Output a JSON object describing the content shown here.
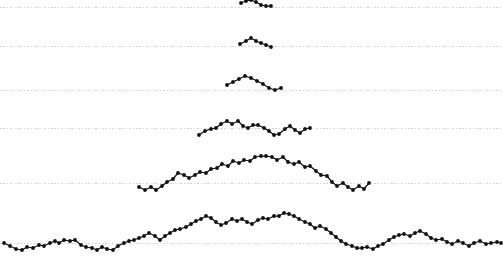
{
  "figure": {
    "background_color": "#ffffff",
    "marker_color": "#111111",
    "line_color": "#111111",
    "gridline_color": "#c9c9c9",
    "caption_clipped": "the caption text is clipped by the figure bottom edge"
  },
  "chart_data": {
    "type": "line",
    "title": "",
    "subtitle": "",
    "xlabel": "",
    "ylabel": "",
    "xlim": [
      0,
      503
    ],
    "ylim": [
      262,
      0
    ],
    "grid": true,
    "grid_orientation": "horizontal",
    "gridline_y_values": [
      7,
      46,
      90,
      128,
      183,
      243
    ],
    "legend_position": "none",
    "annotations": [],
    "tick_labels": {
      "x": [],
      "y": []
    },
    "series": [
      {
        "name": "level-1",
        "baseline_y": 7,
        "marker": "circle",
        "points": [
          [
            241,
            3
          ],
          [
            246,
            1
          ],
          [
            251,
            0
          ],
          [
            256,
            2
          ],
          [
            261,
            5
          ],
          [
            266,
            6
          ],
          [
            271,
            6
          ]
        ]
      },
      {
        "name": "level-2",
        "baseline_y": 46,
        "marker": "circle",
        "points": [
          [
            240,
            44
          ],
          [
            246,
            41
          ],
          [
            251,
            38
          ],
          [
            256,
            41
          ],
          [
            261,
            43
          ],
          [
            266,
            45
          ],
          [
            271,
            47
          ]
        ]
      },
      {
        "name": "level-3",
        "baseline_y": 90,
        "marker": "circle",
        "points": [
          [
            227,
            85
          ],
          [
            233,
            82
          ],
          [
            239,
            79
          ],
          [
            245,
            76
          ],
          [
            251,
            78
          ],
          [
            257,
            81
          ],
          [
            263,
            84
          ],
          [
            269,
            88
          ],
          [
            275,
            90
          ],
          [
            281,
            88
          ]
        ]
      },
      {
        "name": "level-4",
        "baseline_y": 128,
        "marker": "circle",
        "points": [
          [
            199,
            135
          ],
          [
            205,
            131
          ],
          [
            211,
            129
          ],
          [
            216,
            128
          ],
          [
            221,
            124
          ],
          [
            227,
            121
          ],
          [
            232,
            124
          ],
          [
            238,
            121
          ],
          [
            243,
            126
          ],
          [
            248,
            128
          ],
          [
            253,
            125
          ],
          [
            258,
            125
          ],
          [
            264,
            128
          ],
          [
            269,
            131
          ],
          [
            274,
            135
          ],
          [
            279,
            134
          ],
          [
            285,
            129
          ],
          [
            290,
            126
          ],
          [
            295,
            130
          ],
          [
            300,
            133
          ],
          [
            305,
            129
          ],
          [
            310,
            128
          ]
        ]
      },
      {
        "name": "level-5",
        "baseline_y": 183,
        "marker": "circle",
        "points": [
          [
            139,
            187
          ],
          [
            145,
            190
          ],
          [
            151,
            187
          ],
          [
            156,
            190
          ],
          [
            162,
            186
          ],
          [
            167,
            182
          ],
          [
            173,
            179
          ],
          [
            178,
            173
          ],
          [
            184,
            175
          ],
          [
            189,
            178
          ],
          [
            195,
            175
          ],
          [
            200,
            172
          ],
          [
            206,
            173
          ],
          [
            211,
            169
          ],
          [
            217,
            168
          ],
          [
            222,
            164
          ],
          [
            228,
            166
          ],
          [
            233,
            161
          ],
          [
            239,
            163
          ],
          [
            244,
            160
          ],
          [
            250,
            161
          ],
          [
            255,
            157
          ],
          [
            261,
            156
          ],
          [
            266,
            156
          ],
          [
            272,
            157
          ],
          [
            277,
            160
          ],
          [
            283,
            157
          ],
          [
            288,
            162
          ],
          [
            294,
            164
          ],
          [
            299,
            162
          ],
          [
            305,
            167
          ],
          [
            310,
            166
          ],
          [
            316,
            171
          ],
          [
            321,
            175
          ],
          [
            327,
            176
          ],
          [
            332,
            182
          ],
          [
            337,
            186
          ],
          [
            343,
            183
          ],
          [
            348,
            187
          ],
          [
            353,
            190
          ],
          [
            359,
            186
          ],
          [
            364,
            189
          ],
          [
            369,
            183
          ]
        ]
      },
      {
        "name": "level-6",
        "baseline_y": 243,
        "marker": "circle",
        "points": [
          [
            4,
            243
          ],
          [
            10,
            246
          ],
          [
            16,
            249
          ],
          [
            22,
            250
          ],
          [
            27,
            247
          ],
          [
            33,
            248
          ],
          [
            39,
            245
          ],
          [
            44,
            246
          ],
          [
            50,
            243
          ],
          [
            55,
            241
          ],
          [
            59,
            243
          ],
          [
            64,
            240
          ],
          [
            70,
            241
          ],
          [
            75,
            240
          ],
          [
            81,
            245
          ],
          [
            86,
            247
          ],
          [
            92,
            248
          ],
          [
            97,
            250
          ],
          [
            102,
            247
          ],
          [
            107,
            249
          ],
          [
            113,
            250
          ],
          [
            118,
            246
          ],
          [
            124,
            243
          ],
          [
            129,
            241
          ],
          [
            134,
            240
          ],
          [
            139,
            238
          ],
          [
            144,
            236
          ],
          [
            149,
            233
          ],
          [
            155,
            236
          ],
          [
            160,
            240
          ],
          [
            165,
            236
          ],
          [
            170,
            233
          ],
          [
            175,
            230
          ],
          [
            180,
            229
          ],
          [
            186,
            227
          ],
          [
            191,
            224
          ],
          [
            196,
            221
          ],
          [
            201,
            219
          ],
          [
            206,
            216
          ],
          [
            211,
            218
          ],
          [
            216,
            222
          ],
          [
            221,
            225
          ],
          [
            226,
            223
          ],
          [
            232,
            219
          ],
          [
            237,
            221
          ],
          [
            242,
            219
          ],
          [
            247,
            222
          ],
          [
            252,
            224
          ],
          [
            258,
            220
          ],
          [
            263,
            218
          ],
          [
            268,
            219
          ],
          [
            274,
            216
          ],
          [
            279,
            216
          ],
          [
            284,
            213
          ],
          [
            289,
            214
          ],
          [
            294,
            216
          ],
          [
            299,
            219
          ],
          [
            305,
            222
          ],
          [
            310,
            224
          ],
          [
            315,
            228
          ],
          [
            320,
            226
          ],
          [
            326,
            229
          ],
          [
            331,
            233
          ],
          [
            336,
            237
          ],
          [
            341,
            241
          ],
          [
            346,
            244
          ],
          [
            352,
            246
          ],
          [
            357,
            248
          ],
          [
            362,
            248
          ],
          [
            367,
            247
          ],
          [
            373,
            249
          ],
          [
            378,
            246
          ],
          [
            383,
            244
          ],
          [
            389,
            240
          ],
          [
            394,
            237
          ],
          [
            399,
            235
          ],
          [
            404,
            234
          ],
          [
            410,
            236
          ],
          [
            415,
            233
          ],
          [
            420,
            231
          ],
          [
            426,
            234
          ],
          [
            431,
            238
          ],
          [
            436,
            240
          ],
          [
            442,
            239
          ],
          [
            447,
            242
          ],
          [
            452,
            244
          ],
          [
            458,
            241
          ],
          [
            463,
            243
          ],
          [
            469,
            246
          ],
          [
            474,
            243
          ],
          [
            480,
            241
          ],
          [
            486,
            244
          ],
          [
            491,
            243
          ],
          [
            497,
            242
          ],
          [
            501,
            243
          ]
        ]
      }
    ]
  },
  "caption": {
    "clipped_text": "the descending caption line partially visible at the bottom edge"
  }
}
